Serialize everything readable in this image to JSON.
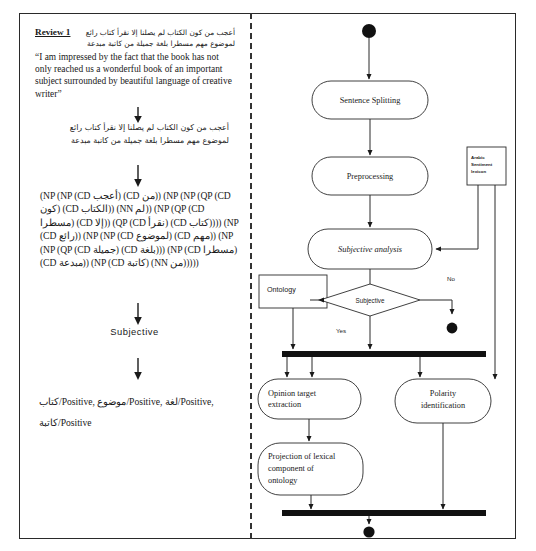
{
  "document": {
    "title": "Arabic sentiment analysis pipeline example and activity diagram"
  },
  "left_panel": {
    "review_label": "Review 1",
    "review_arabic": "أعجب من كون الكتاب لم يصلنا إلا نقرأ كتاب رائع لموضوع مهم مسطرا بلغة جميلة من كاتبة مبدعة",
    "review_english": "“I am impressed by the fact that the book has not only reached us a wonderful book of an important subject surrounded by beautiful language of creative writer”",
    "normalized_arabic": "أعجب من كون الكتاب لم يصلنا إلا نقرأ كتاب رائع لموضوع مهم مسطرا بلغة جميلة من كاتبة مبدعة",
    "parse_tree": "(NP (NP (CD أعجب) (CD من)) (NP (NP (QP (CD كون) (CD الكتاب)) (NN لم)) (NP (QP (CD مسطرا) (CD إلا)) (QP (CD نقرأ) (CD كتاب)))) (NP (CD رائع)) (NP (NP (CD لموضوع) (CD مهم)) (NP (NP (QP (CD جميلة) (CD بلغة))) (NP (CD مسطرا) (CD مبدعة)) (NP (CD كاتبة) (NN من)))))",
    "subjectivity_result": "Subjective",
    "polarity_results": [
      {
        "term": "كتاب",
        "polarity": "Positive"
      },
      {
        "term": "موضوع",
        "polarity": "Positive"
      },
      {
        "term": "لغة",
        "polarity": "Positive"
      },
      {
        "term": "كاتبة",
        "polarity": "Positive"
      }
    ],
    "polarity_line_1": "كتاب/Positive, موضوع/Positive, لغة/Positive,",
    "polarity_line_2": "كاتبة/Positive"
  },
  "diagram": {
    "type": "uml-activity-diagram",
    "nodes": [
      {
        "id": "start",
        "kind": "initial-node",
        "label": ""
      },
      {
        "id": "sentence-splitting",
        "kind": "activity",
        "label": "Sentence Splitting"
      },
      {
        "id": "preprocessing",
        "kind": "activity",
        "label": "Preprocessing"
      },
      {
        "id": "subjective-analysis",
        "kind": "activity",
        "label": "Subjective analysis"
      },
      {
        "id": "lexicon",
        "kind": "datastore",
        "label": "Arabic Sentiment lexicon",
        "label_lines": [
          "Arabic",
          "Sentiment",
          "lexicon"
        ]
      },
      {
        "id": "ontology",
        "kind": "datastore",
        "label": "Ontology"
      },
      {
        "id": "subjective-decision",
        "kind": "decision",
        "label": "Subjective"
      },
      {
        "id": "fork-1",
        "kind": "fork-bar",
        "label": ""
      },
      {
        "id": "opinion-target",
        "kind": "activity",
        "label": "Opinion target extraction",
        "label_lines": [
          "Opinion target",
          "extraction"
        ]
      },
      {
        "id": "polarity-identification",
        "kind": "activity",
        "label": "Polarity identification",
        "label_lines": [
          "Polarity",
          "identification"
        ]
      },
      {
        "id": "projection",
        "kind": "activity",
        "label": "Projection of lexical component of ontology",
        "label_lines": [
          "Projection of lexical",
          "component of",
          "ontology"
        ]
      },
      {
        "id": "join-1",
        "kind": "join-bar",
        "label": ""
      },
      {
        "id": "end-no",
        "kind": "final-node",
        "label": ""
      },
      {
        "id": "end-main",
        "kind": "final-node",
        "label": ""
      }
    ],
    "guards": {
      "yes": "Yes",
      "no": "No"
    }
  }
}
